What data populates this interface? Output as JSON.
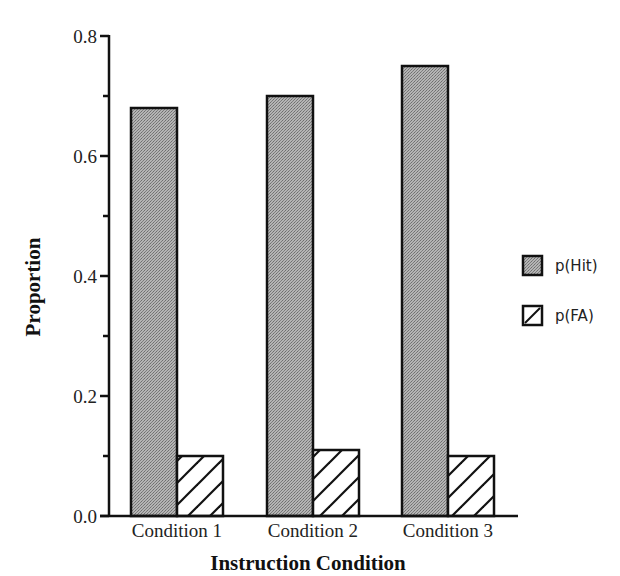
{
  "chart_data": {
    "type": "bar",
    "title": "",
    "xlabel": "Instruction Condition",
    "ylabel": "Proportion",
    "categories": [
      "Condition 1",
      "Condition 2",
      "Condition 3"
    ],
    "series": [
      {
        "name": "p(Hit)",
        "values": [
          0.68,
          0.7,
          0.75
        ],
        "fill": "gray-dither",
        "color": "#a8a8a8"
      },
      {
        "name": "p(FA)",
        "values": [
          0.1,
          0.11,
          0.1
        ],
        "fill": "diagonal-hatch",
        "color": "#ffffff"
      }
    ],
    "ylim": [
      0.0,
      0.8
    ],
    "yticks": [
      0.0,
      0.2,
      0.4,
      0.6,
      0.8
    ],
    "ytick_labels": [
      "0.0",
      "0.2",
      "0.4",
      "0.6",
      "0.8"
    ],
    "minor_yticks": [
      0.1,
      0.3,
      0.5,
      0.7
    ],
    "grid": false,
    "legend_position": "right"
  },
  "legend": {
    "items": [
      {
        "label": "p(Hit)"
      },
      {
        "label": "p(FA)"
      }
    ]
  }
}
